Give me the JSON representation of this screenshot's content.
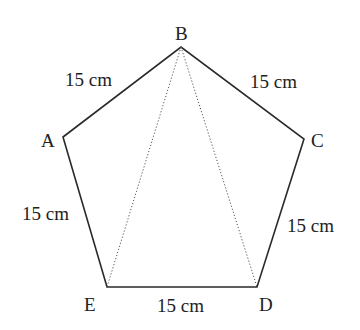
{
  "figure": {
    "vertices": [
      {
        "name": "A",
        "x": 63,
        "y": 137,
        "label_x": 41,
        "label_y": 147
      },
      {
        "name": "B",
        "x": 181,
        "y": 47,
        "label_x": 175,
        "label_y": 40
      },
      {
        "name": "C",
        "x": 304,
        "y": 139,
        "label_x": 311,
        "label_y": 147
      },
      {
        "name": "D",
        "x": 257,
        "y": 287,
        "label_x": 259,
        "label_y": 311
      },
      {
        "name": "E",
        "x": 107,
        "y": 287,
        "label_x": 84,
        "label_y": 311
      }
    ],
    "sides": [
      {
        "id": "AB",
        "label": "15 cm",
        "label_x": 65,
        "label_y": 86
      },
      {
        "id": "BC",
        "label": "15 cm",
        "label_x": 250,
        "label_y": 88
      },
      {
        "id": "CD",
        "label": "15 cm",
        "label_x": 287,
        "label_y": 232
      },
      {
        "id": "DE",
        "label": "15 cm",
        "label_x": 157,
        "label_y": 312
      },
      {
        "id": "EA",
        "label": "15 cm",
        "label_x": 22,
        "label_y": 220
      }
    ],
    "diagonals": [
      {
        "id": "BE",
        "style": "dotted"
      },
      {
        "id": "BD",
        "style": "dotted"
      }
    ]
  }
}
